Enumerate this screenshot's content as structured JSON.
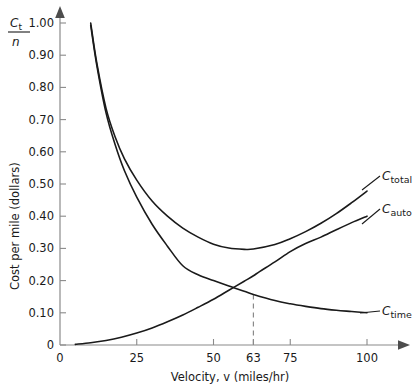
{
  "chart_data": {
    "type": "line",
    "title": "",
    "xlabel": "Velocity, v (miles/hr)",
    "ylabel": "Cost per mile (dollars)",
    "y_axis_symbol_numerator": "C",
    "y_axis_symbol_numerator_sub": "t",
    "y_axis_symbol_denominator": "n",
    "xlim": [
      0,
      108
    ],
    "ylim": [
      0,
      1.05
    ],
    "grid": false,
    "legend_position": "inline-right-labels",
    "xticks": [
      0,
      25,
      50,
      63,
      75,
      100
    ],
    "xtick_labels": [
      "0",
      "25",
      "50",
      "63",
      "75",
      "100"
    ],
    "yticks": [
      0,
      0.1,
      0.2,
      0.3,
      0.4,
      0.5,
      0.6,
      0.7,
      0.8,
      0.9,
      1.0
    ],
    "ytick_labels": [
      "0",
      "0.10",
      "0.20",
      "0.30",
      "0.40",
      "0.50",
      "0.60",
      "0.70",
      "0.80",
      "0.90",
      "1.00"
    ],
    "series": [
      {
        "name": "C_total",
        "label_base": "C",
        "label_sub": "total",
        "x": [
          10,
          12,
          15,
          18,
          21,
          25,
          30,
          35,
          40,
          45,
          50,
          55,
          60,
          63,
          70,
          75,
          80,
          85,
          90,
          95,
          100
        ],
        "values": [
          1.0,
          0.875,
          0.735,
          0.645,
          0.578,
          0.512,
          0.447,
          0.4,
          0.363,
          0.335,
          0.313,
          0.301,
          0.297,
          0.298,
          0.312,
          0.33,
          0.352,
          0.378,
          0.408,
          0.442,
          0.478
        ]
      },
      {
        "name": "C_auto",
        "label_base": "C",
        "label_sub": "auto",
        "x": [
          5,
          10,
          15,
          20,
          25,
          30,
          35,
          40,
          45,
          50,
          55,
          60,
          63,
          65,
          70,
          75,
          80,
          85,
          90,
          95,
          100
        ],
        "values": [
          0.002,
          0.007,
          0.014,
          0.024,
          0.037,
          0.053,
          0.072,
          0.093,
          0.117,
          0.142,
          0.17,
          0.198,
          0.215,
          0.228,
          0.258,
          0.29,
          0.315,
          0.335,
          0.358,
          0.38,
          0.4
        ]
      },
      {
        "name": "C_time",
        "label_base": "C",
        "label_sub": "time",
        "x": [
          10,
          12,
          15,
          18,
          21,
          25,
          30,
          35,
          40,
          45,
          50,
          55,
          60,
          63,
          70,
          75,
          80,
          85,
          90,
          95,
          100
        ],
        "values": [
          0.993,
          0.868,
          0.721,
          0.621,
          0.541,
          0.459,
          0.375,
          0.307,
          0.246,
          0.218,
          0.2,
          0.183,
          0.167,
          0.157,
          0.138,
          0.128,
          0.12,
          0.113,
          0.108,
          0.104,
          0.1
        ]
      }
    ],
    "annotations": [
      {
        "name": "intersection-guide",
        "kind": "vertical-dashed",
        "x": 63,
        "y_top": 0.157,
        "y_bottom": 0,
        "tick_label": "63"
      }
    ]
  }
}
